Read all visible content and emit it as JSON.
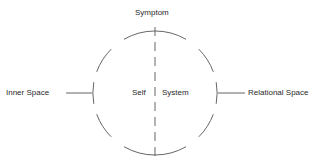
{
  "diagram": {
    "top_label": "Symptom",
    "left_label": "Inner Space",
    "right_label": "Relational Space",
    "center_left": "Self",
    "center_divider": "|",
    "center_right": "System",
    "stroke_color": "#555555"
  }
}
